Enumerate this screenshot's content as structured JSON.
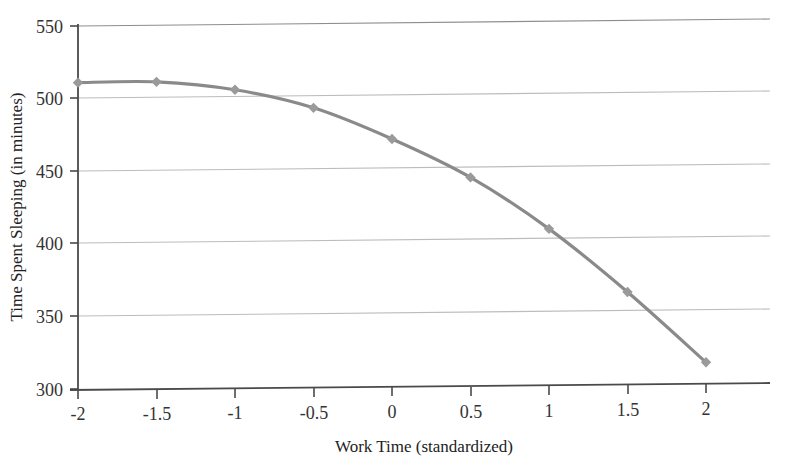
{
  "chart_data": {
    "type": "line",
    "title": "",
    "subtitle": "",
    "xlabel": "Work Time (standardized)",
    "ylabel": "Time Spent Sleeping (in minutes)",
    "x": [
      -2,
      -1.5,
      -1,
      -0.5,
      0,
      0.5,
      1,
      1.5,
      2
    ],
    "values": [
      511,
      511,
      505,
      492,
      470,
      443,
      407,
      363,
      314
    ],
    "series": [
      {
        "name": "Time Spent Sleeping",
        "values": [
          511,
          511,
          505,
          492,
          470,
          443,
          407,
          363,
          314
        ]
      }
    ],
    "xlim": [
      -2.2,
      2.45
    ],
    "ylim": [
      300,
      550
    ],
    "xticks": [
      -2,
      -1.5,
      -1,
      -0.5,
      0,
      0.5,
      1,
      1.5,
      2
    ],
    "xtick_labels": [
      "-2",
      "-1.5",
      "-1",
      "-0.5",
      "0",
      "0.5",
      "1",
      "1.5",
      "2"
    ],
    "yticks": [
      300,
      350,
      400,
      450,
      500,
      550
    ],
    "ytick_labels": [
      "300",
      "350",
      "400",
      "450",
      "500",
      "550"
    ],
    "grid": "horizontal",
    "legend": "none",
    "marker": "diamond",
    "line_color": "#8a8a8a",
    "marker_color": "#9a9a9a",
    "grid_color": "#b9b9b9",
    "axis_color": "#4a4a4a",
    "background": "#ffffff"
  }
}
